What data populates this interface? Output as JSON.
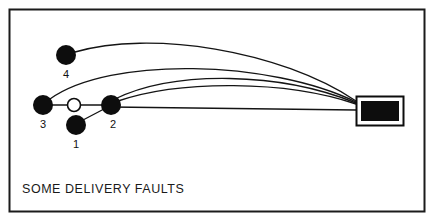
{
  "figure": {
    "caption": "SOME DELIVERY FAULTS",
    "frame": {
      "stroke_color": "#1b1b1b",
      "fill_color": "#ffffff",
      "x": 9,
      "y": 9,
      "width": 416,
      "height": 203
    },
    "nodes": [
      {
        "id": "node-1",
        "label": "1",
        "style": "filled",
        "fill_color": "#0d0d0d",
        "cx": 76,
        "cy": 125,
        "r": 10,
        "label_x": 76,
        "label_y": 148
      },
      {
        "id": "node-2",
        "label": "2",
        "style": "filled",
        "fill_color": "#0d0d0d",
        "cx": 111,
        "cy": 105,
        "r": 10,
        "label_x": 113,
        "label_y": 128
      },
      {
        "id": "node-3",
        "label": "3",
        "style": "filled",
        "fill_color": "#0d0d0d",
        "cx": 43,
        "cy": 105,
        "r": 10,
        "label_x": 43,
        "label_y": 128
      },
      {
        "id": "node-4",
        "label": "4",
        "style": "filled",
        "fill_color": "#0d0d0d",
        "cx": 66,
        "cy": 55,
        "r": 10,
        "label_x": 66,
        "label_y": 78
      },
      {
        "id": "node-hollow",
        "label": "",
        "style": "hollow",
        "fill_color": "#ffffff",
        "cx": 74,
        "cy": 105,
        "r": 7,
        "label_x": 74,
        "label_y": 105
      }
    ],
    "target": {
      "id": "delivery-target",
      "outer": {
        "x": 356,
        "y": 96,
        "width": 48,
        "height": 30
      },
      "inner": {
        "x": 361,
        "y": 101,
        "width": 38,
        "height": 20
      },
      "outer_stroke": "#0d0d0d",
      "gap_fill": "#ffffff",
      "inner_fill": "#0d0d0d"
    },
    "links": [
      {
        "id": "link-3-to-hollow",
        "kind": "straight",
        "from": "node-3",
        "to": "node-hollow",
        "path": "M 52 105 L 68 105"
      },
      {
        "id": "link-hollow-to-2",
        "kind": "straight",
        "from": "node-hollow",
        "to": "node-2",
        "path": "M 81 105 L 103 105"
      },
      {
        "id": "link-1-to-2",
        "kind": "straight",
        "from": "node-1",
        "to": "node-2",
        "path": "M 83 120 L 104 109"
      },
      {
        "id": "link-2-to-target-straight",
        "kind": "straight",
        "from": "node-2",
        "to": "delivery-target",
        "path": "M 111 107 L 356 110"
      },
      {
        "id": "arc-4-to-target",
        "kind": "arc",
        "from": "node-4",
        "to": "delivery-target",
        "path": "M 75 52 C 150 30 280 50 356 101"
      },
      {
        "id": "arc-3-to-target",
        "kind": "arc",
        "from": "node-3",
        "to": "delivery-target",
        "path": "M 50 99 C 110 56 270 60 356 102"
      },
      {
        "id": "arc-2-to-target-upper",
        "kind": "arc",
        "from": "node-2",
        "to": "delivery-target",
        "path": "M 115 99 C 175 70 280 72 356 103"
      },
      {
        "id": "arc-2-to-target-lower",
        "kind": "arc",
        "from": "node-2",
        "to": "delivery-target",
        "path": "M 118 101 C 180 80 285 80 356 104"
      }
    ],
    "stroke_color": "#141414"
  }
}
